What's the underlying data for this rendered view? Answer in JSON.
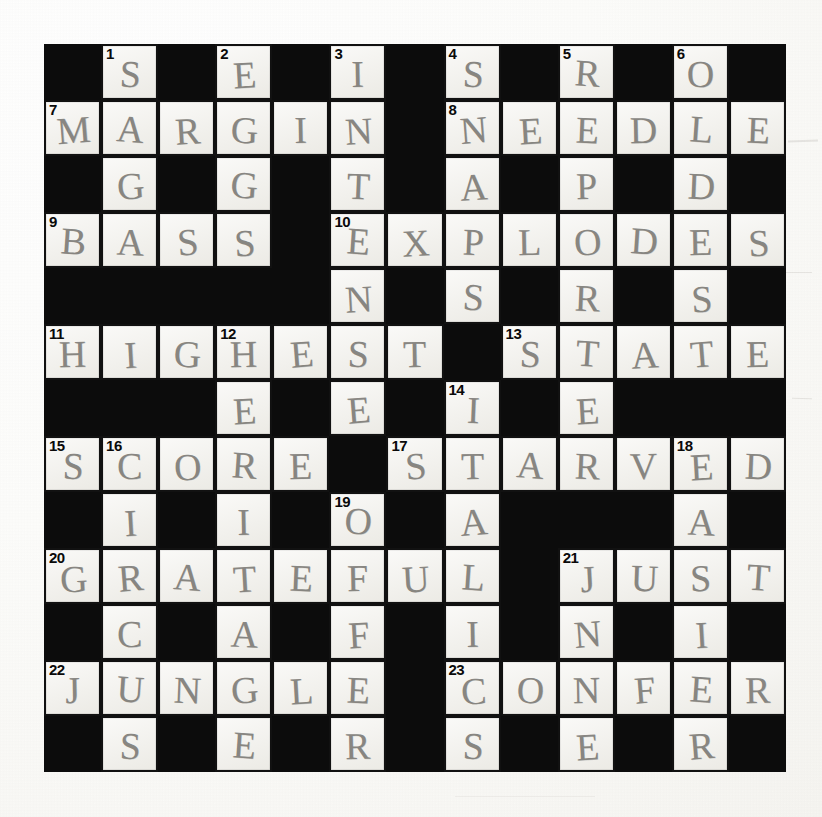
{
  "document": {
    "type": "crossword-puzzle",
    "title": "Completed crossword grid (hand filled in pencil)",
    "grid": {
      "columns": 13,
      "rows": 13
    },
    "background_color": "#fdfdfb",
    "block_color": "#0c0c0c",
    "cell_color": "#f4f3ef",
    "pencil_color": "#5f5d58"
  },
  "cells": [
    [
      {
        "t": "block"
      },
      {
        "t": "open",
        "num": "1",
        "l": "S"
      },
      {
        "t": "block"
      },
      {
        "t": "open",
        "num": "2",
        "l": "E"
      },
      {
        "t": "block"
      },
      {
        "t": "open",
        "num": "3",
        "l": "I"
      },
      {
        "t": "block"
      },
      {
        "t": "open",
        "num": "4",
        "l": "S"
      },
      {
        "t": "block"
      },
      {
        "t": "open",
        "num": "5",
        "l": "R"
      },
      {
        "t": "block"
      },
      {
        "t": "open",
        "num": "6",
        "l": "O"
      },
      {
        "t": "block"
      }
    ],
    [
      {
        "t": "open",
        "num": "7",
        "l": "M"
      },
      {
        "t": "open",
        "l": "A"
      },
      {
        "t": "open",
        "l": "R"
      },
      {
        "t": "open",
        "l": "G"
      },
      {
        "t": "open",
        "l": "I"
      },
      {
        "t": "open",
        "l": "N"
      },
      {
        "t": "block"
      },
      {
        "t": "open",
        "num": "8",
        "l": "N"
      },
      {
        "t": "open",
        "l": "E"
      },
      {
        "t": "open",
        "l": "E"
      },
      {
        "t": "open",
        "l": "D"
      },
      {
        "t": "open",
        "l": "L"
      },
      {
        "t": "open",
        "l": "E"
      }
    ],
    [
      {
        "t": "block"
      },
      {
        "t": "open",
        "l": "G"
      },
      {
        "t": "block"
      },
      {
        "t": "open",
        "l": "G"
      },
      {
        "t": "block"
      },
      {
        "t": "open",
        "l": "T"
      },
      {
        "t": "block"
      },
      {
        "t": "open",
        "l": "A"
      },
      {
        "t": "block"
      },
      {
        "t": "open",
        "l": "P"
      },
      {
        "t": "block"
      },
      {
        "t": "open",
        "l": "D"
      },
      {
        "t": "block"
      }
    ],
    [
      {
        "t": "open",
        "num": "9",
        "l": "B"
      },
      {
        "t": "open",
        "l": "A"
      },
      {
        "t": "open",
        "l": "S"
      },
      {
        "t": "open",
        "l": "S"
      },
      {
        "t": "block"
      },
      {
        "t": "open",
        "num": "10",
        "l": "E"
      },
      {
        "t": "open",
        "l": "X"
      },
      {
        "t": "open",
        "l": "P"
      },
      {
        "t": "open",
        "l": "L"
      },
      {
        "t": "open",
        "l": "O"
      },
      {
        "t": "open",
        "l": "D"
      },
      {
        "t": "open",
        "l": "E"
      },
      {
        "t": "open",
        "l": "S"
      }
    ],
    [
      {
        "t": "block"
      },
      {
        "t": "block"
      },
      {
        "t": "block"
      },
      {
        "t": "block"
      },
      {
        "t": "block"
      },
      {
        "t": "open",
        "l": "N"
      },
      {
        "t": "block"
      },
      {
        "t": "open",
        "l": "S"
      },
      {
        "t": "block"
      },
      {
        "t": "open",
        "l": "R"
      },
      {
        "t": "block"
      },
      {
        "t": "open",
        "l": "S"
      },
      {
        "t": "block"
      }
    ],
    [
      {
        "t": "open",
        "num": "11",
        "l": "H"
      },
      {
        "t": "open",
        "l": "I"
      },
      {
        "t": "open",
        "l": "G"
      },
      {
        "t": "open",
        "num": "12",
        "l": "H"
      },
      {
        "t": "open",
        "l": "E"
      },
      {
        "t": "open",
        "l": "S"
      },
      {
        "t": "open",
        "l": "T"
      },
      {
        "t": "block"
      },
      {
        "t": "open",
        "num": "13",
        "l": "S"
      },
      {
        "t": "open",
        "l": "T"
      },
      {
        "t": "open",
        "l": "A"
      },
      {
        "t": "open",
        "l": "T"
      },
      {
        "t": "open",
        "l": "E"
      }
    ],
    [
      {
        "t": "block"
      },
      {
        "t": "block"
      },
      {
        "t": "block"
      },
      {
        "t": "open",
        "l": "E"
      },
      {
        "t": "block"
      },
      {
        "t": "open",
        "l": "E"
      },
      {
        "t": "block"
      },
      {
        "t": "open",
        "num": "14",
        "l": "I"
      },
      {
        "t": "block"
      },
      {
        "t": "open",
        "l": "E"
      },
      {
        "t": "block"
      },
      {
        "t": "block"
      },
      {
        "t": "block"
      }
    ],
    [
      {
        "t": "open",
        "num": "15",
        "l": "S"
      },
      {
        "t": "open",
        "num": "16",
        "l": "C"
      },
      {
        "t": "open",
        "l": "O"
      },
      {
        "t": "open",
        "l": "R"
      },
      {
        "t": "open",
        "l": "E"
      },
      {
        "t": "block"
      },
      {
        "t": "open",
        "num": "17",
        "l": "S"
      },
      {
        "t": "open",
        "l": "T"
      },
      {
        "t": "open",
        "l": "A"
      },
      {
        "t": "open",
        "l": "R"
      },
      {
        "t": "open",
        "l": "V"
      },
      {
        "t": "open",
        "num": "18",
        "l": "E"
      },
      {
        "t": "open",
        "l": "D"
      }
    ],
    [
      {
        "t": "block"
      },
      {
        "t": "open",
        "l": "I"
      },
      {
        "t": "block"
      },
      {
        "t": "open",
        "l": "I"
      },
      {
        "t": "block"
      },
      {
        "t": "open",
        "num": "19",
        "l": "O"
      },
      {
        "t": "block"
      },
      {
        "t": "open",
        "l": "A"
      },
      {
        "t": "block"
      },
      {
        "t": "block"
      },
      {
        "t": "block"
      },
      {
        "t": "open",
        "l": "A"
      },
      {
        "t": "block"
      }
    ],
    [
      {
        "t": "open",
        "num": "20",
        "l": "G"
      },
      {
        "t": "open",
        "l": "R"
      },
      {
        "t": "open",
        "l": "A"
      },
      {
        "t": "open",
        "l": "T"
      },
      {
        "t": "open",
        "l": "E"
      },
      {
        "t": "open",
        "l": "F"
      },
      {
        "t": "open",
        "l": "U"
      },
      {
        "t": "open",
        "l": "L"
      },
      {
        "t": "block"
      },
      {
        "t": "open",
        "num": "21",
        "l": "J"
      },
      {
        "t": "open",
        "l": "U"
      },
      {
        "t": "open",
        "l": "S"
      },
      {
        "t": "open",
        "l": "T"
      }
    ],
    [
      {
        "t": "block"
      },
      {
        "t": "open",
        "l": "C"
      },
      {
        "t": "block"
      },
      {
        "t": "open",
        "l": "A"
      },
      {
        "t": "block"
      },
      {
        "t": "open",
        "l": "F"
      },
      {
        "t": "block"
      },
      {
        "t": "open",
        "l": "I"
      },
      {
        "t": "block"
      },
      {
        "t": "open",
        "l": "N"
      },
      {
        "t": "block"
      },
      {
        "t": "open",
        "l": "I"
      },
      {
        "t": "block"
      }
    ],
    [
      {
        "t": "open",
        "num": "22",
        "l": "J"
      },
      {
        "t": "open",
        "l": "U"
      },
      {
        "t": "open",
        "l": "N"
      },
      {
        "t": "open",
        "l": "G"
      },
      {
        "t": "open",
        "l": "L"
      },
      {
        "t": "open",
        "l": "E"
      },
      {
        "t": "block"
      },
      {
        "t": "open",
        "num": "23",
        "l": "C"
      },
      {
        "t": "open",
        "l": "O"
      },
      {
        "t": "open",
        "l": "N"
      },
      {
        "t": "open",
        "l": "F"
      },
      {
        "t": "open",
        "l": "E"
      },
      {
        "t": "open",
        "l": "R"
      }
    ],
    [
      {
        "t": "block"
      },
      {
        "t": "open",
        "l": "S"
      },
      {
        "t": "block"
      },
      {
        "t": "open",
        "l": "E"
      },
      {
        "t": "block"
      },
      {
        "t": "open",
        "l": "R"
      },
      {
        "t": "block"
      },
      {
        "t": "open",
        "l": "S"
      },
      {
        "t": "block"
      },
      {
        "t": "open",
        "l": "E"
      },
      {
        "t": "block"
      },
      {
        "t": "open",
        "l": "R"
      },
      {
        "t": "block"
      }
    ]
  ],
  "answers": {
    "across": [
      {
        "num": "7",
        "text": "MARGIN"
      },
      {
        "num": "8",
        "text": "NEEDLE"
      },
      {
        "num": "9",
        "text": "BASS"
      },
      {
        "num": "10",
        "text": "EXPLODES"
      },
      {
        "num": "11",
        "text": "HIGHEST"
      },
      {
        "num": "13",
        "text": "STATE"
      },
      {
        "num": "15",
        "text": "SCORE"
      },
      {
        "num": "17",
        "text": "STARVED"
      },
      {
        "num": "20",
        "text": "GRATEFUL"
      },
      {
        "num": "21",
        "text": "JUST"
      },
      {
        "num": "22",
        "text": "JUNGLE"
      },
      {
        "num": "23",
        "text": "CONFER"
      }
    ],
    "down": [
      {
        "num": "1",
        "text": "SAGA"
      },
      {
        "num": "2",
        "text": "EGGS"
      },
      {
        "num": "3",
        "text": "INTENSE"
      },
      {
        "num": "4",
        "text": "SNAPS"
      },
      {
        "num": "5",
        "text": "REPORTER"
      },
      {
        "num": "6",
        "text": "OLDEST"
      },
      {
        "num": "12",
        "text": "HERITAGE"
      },
      {
        "num": "14",
        "text": "ITALICS"
      },
      {
        "num": "16",
        "text": "CIRCUS"
      },
      {
        "num": "18",
        "text": "EASIER"
      },
      {
        "num": "19",
        "text": "OFFER"
      }
    ]
  }
}
